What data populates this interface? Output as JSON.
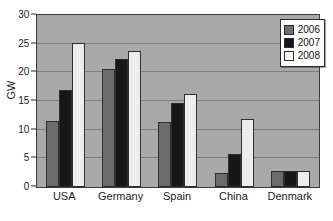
{
  "chart_data": {
    "type": "bar",
    "title": "",
    "xlabel": "",
    "ylabel": "GW",
    "ylim": [
      0,
      30
    ],
    "ytick_step": 5,
    "yticks": [
      0,
      5,
      10,
      15,
      20,
      25,
      30
    ],
    "ytick_labels": [
      "0",
      "5",
      "10",
      "15",
      "20",
      "25",
      "30"
    ],
    "grid": true,
    "grid_axis": "y",
    "legend_position": "top-right",
    "categories": [
      "USA",
      "Germany",
      "Spain",
      "China",
      "Denmark"
    ],
    "series": [
      {
        "name": "2006",
        "color": "#6c6c6c",
        "values": [
          11.6,
          20.6,
          11.4,
          2.4,
          2.8
        ]
      },
      {
        "name": "2007",
        "color": "#17171a",
        "values": [
          16.9,
          22.3,
          14.7,
          5.7,
          2.8
        ]
      },
      {
        "name": "2008",
        "color": "#ededed",
        "values": [
          25.2,
          23.8,
          16.2,
          11.8,
          2.8
        ]
      }
    ]
  },
  "style": {
    "plot_background": "#a9a9a9",
    "page_background": "#ffffff",
    "gridline_color": "#7d7d7d",
    "axis_color": "#2b2b2b",
    "text_color": "#1a1a1a"
  }
}
